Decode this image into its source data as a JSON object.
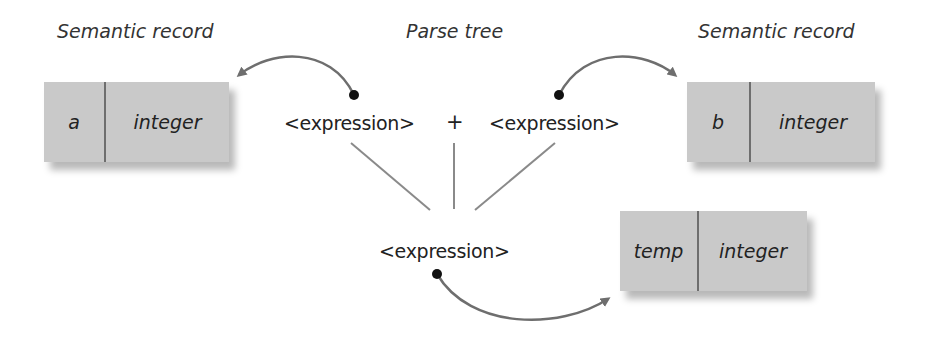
{
  "titles": {
    "left": "Semantic record",
    "center": "Parse tree",
    "right": "Semantic record"
  },
  "records": {
    "a": {
      "name": "a",
      "type": "integer"
    },
    "b": {
      "name": "b",
      "type": "integer"
    },
    "temp": {
      "name": "temp",
      "type": "integer"
    }
  },
  "parse_tree": {
    "left_child": "<expression>",
    "operator": "+",
    "right_child": "<expression>",
    "root": "<expression>"
  },
  "colors": {
    "record_fill": "#c9c9c9",
    "arrow": "#6e6e6e",
    "tree_line": "#8a8a8a"
  }
}
